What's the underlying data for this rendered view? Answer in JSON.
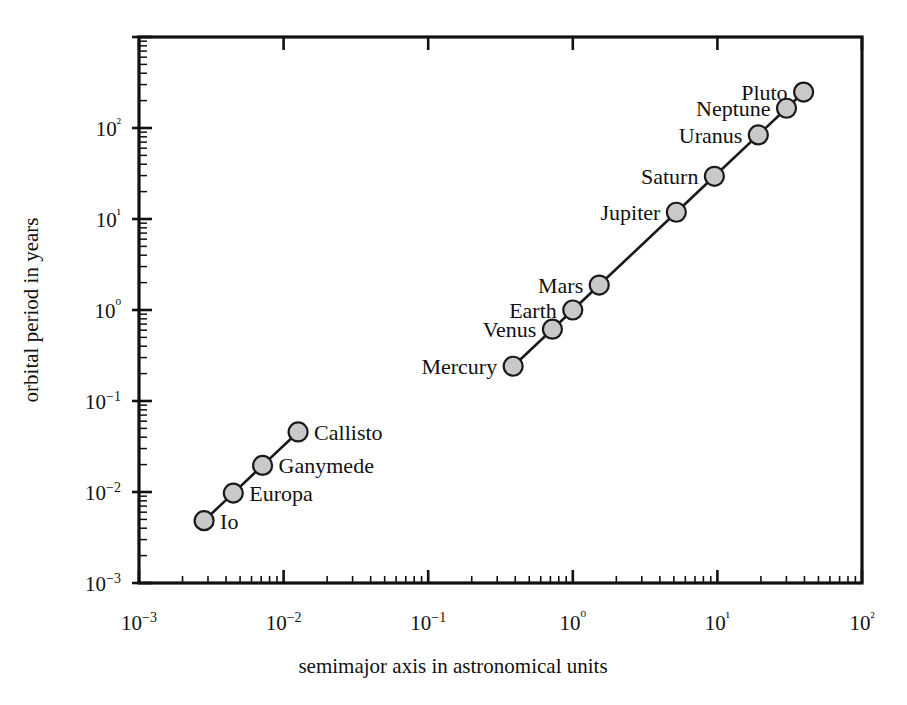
{
  "chart_data": {
    "type": "scatter",
    "title": "",
    "subtitle": "",
    "xlabel": "semimajor axis in astronomical units",
    "ylabel": "orbital period in years",
    "xscale": "log",
    "yscale": "log",
    "xlim": [
      0.001,
      100
    ],
    "ylim": [
      0.001,
      1000
    ],
    "grid": false,
    "legend": null,
    "xtick_labels": [
      "10−3",
      "10−2",
      "10−1",
      "10⁰",
      "10¹",
      "10²"
    ],
    "xtick_values": [
      0.001,
      0.01,
      0.1,
      1,
      10,
      100
    ],
    "ytick_labels": [
      "10−3",
      "10−2",
      "10−1",
      "10⁰",
      "10¹",
      "10²"
    ],
    "ytick_values": [
      0.001,
      0.01,
      0.1,
      1,
      10,
      100
    ],
    "marker_fill": "#c9c9c9",
    "marker_edge": "#1a1a1a",
    "line_color": "#1a1a1a",
    "series": [
      {
        "name": "Galilean moons of Jupiter",
        "connected": true,
        "points": [
          {
            "label": "Io",
            "x": 0.00282,
            "y": 0.00484,
            "label_pos": "right"
          },
          {
            "label": "Europa",
            "x": 0.00449,
            "y": 0.00972,
            "label_pos": "right"
          },
          {
            "label": "Ganymede",
            "x": 0.00716,
            "y": 0.0196,
            "label_pos": "right"
          },
          {
            "label": "Callisto",
            "x": 0.0126,
            "y": 0.0457,
            "label_pos": "right"
          }
        ]
      },
      {
        "name": "Planets of the Solar System",
        "connected": true,
        "points": [
          {
            "label": "Mercury",
            "x": 0.387,
            "y": 0.241,
            "label_pos": "left"
          },
          {
            "label": "Venus",
            "x": 0.723,
            "y": 0.615,
            "label_pos": "left"
          },
          {
            "label": "Earth",
            "x": 1.0,
            "y": 1.0,
            "label_pos": "left"
          },
          {
            "label": "Mars",
            "x": 1.524,
            "y": 1.881,
            "label_pos": "left"
          },
          {
            "label": "Jupiter",
            "x": 5.203,
            "y": 11.86,
            "label_pos": "left"
          },
          {
            "label": "Saturn",
            "x": 9.537,
            "y": 29.46,
            "label_pos": "left"
          },
          {
            "label": "Uranus",
            "x": 19.19,
            "y": 84.01,
            "label_pos": "left"
          },
          {
            "label": "Neptune",
            "x": 30.07,
            "y": 164.8,
            "label_pos": "left"
          },
          {
            "label": "Pluto",
            "x": 39.48,
            "y": 248.0,
            "label_pos": "left"
          }
        ]
      }
    ]
  },
  "axes": {
    "x_title": "semimajor axis in astronomical units",
    "y_title": "orbital period in years"
  }
}
